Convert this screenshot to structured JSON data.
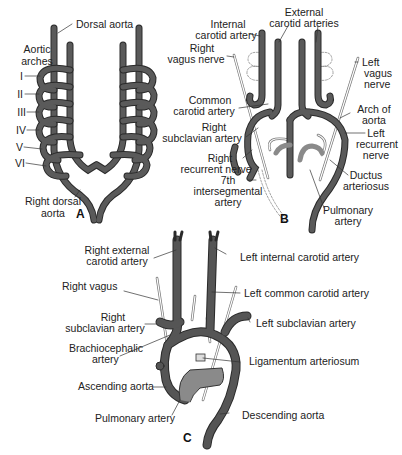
{
  "figure": {
    "colors": {
      "vessel": "#555555",
      "vessel_outline": "#2a2a2a",
      "pulmonary": "#8a8a8a",
      "nerve": "#ffffff",
      "nerve_outline": "#777777",
      "regressed": "#9a9a9a",
      "background": "#ffffff",
      "text": "#222222"
    },
    "panel_a": {
      "letter": "A",
      "labels": {
        "dorsal_aorta": "Dorsal aorta",
        "aortic_arches_1": "Aortic",
        "aortic_arches_2": "arches",
        "arch_1": "I",
        "arch_2": "II",
        "arch_3": "III",
        "arch_4": "IV",
        "arch_5": "V",
        "arch_6": "VI",
        "right_dorsal_aorta_1": "Right dorsal",
        "right_dorsal_aorta_2": "aorta"
      }
    },
    "panel_b": {
      "letter": "B",
      "labels": {
        "external_carotid_1": "External",
        "external_carotid_2": "carotid arteries",
        "internal_carotid_1": "Internal",
        "internal_carotid_2": "carotid artery",
        "right_vagus_1": "Right",
        "right_vagus_2": "vagus nerve",
        "left_vagus_1": "Left",
        "left_vagus_2": "vagus",
        "left_vagus_3": "nerve",
        "common_carotid_1": "Common",
        "common_carotid_2": "carotid artery",
        "arch_aorta_1": "Arch of",
        "arch_aorta_2": "aorta",
        "right_subclavian_1": "Right",
        "right_subclavian_2": "subclavian artery",
        "left_recurrent_1": "Left",
        "left_recurrent_2": "recurrent",
        "left_recurrent_3": "nerve",
        "right_recurrent_1": "Right",
        "right_recurrent_2": "recurrent nerve",
        "ductus_1": "Ductus",
        "ductus_2": "arteriosus",
        "intersegmental_1": "7th",
        "intersegmental_2": "intersegmental",
        "intersegmental_3": "artery",
        "pulmonary_1": "Pulmonary",
        "pulmonary_2": "artery"
      }
    },
    "panel_c": {
      "letter": "C",
      "labels": {
        "right_external_carotid_1": "Right external",
        "right_external_carotid_2": "carotid artery",
        "left_internal_carotid": "Left internal carotid artery",
        "right_vagus": "Right vagus",
        "left_common_carotid": "Left common carotid artery",
        "right_subclavian_1": "Right",
        "right_subclavian_2": "subclavian artery",
        "left_subclavian": "Left subclavian artery",
        "brachiocephalic_1": "Brachiocephalic",
        "brachiocephalic_2": "artery",
        "ligamentum": "Ligamentum arteriosum",
        "ascending_aorta": "Ascending aorta",
        "descending_aorta": "Descending aorta",
        "pulmonary_artery": "Pulmonary artery"
      }
    }
  }
}
